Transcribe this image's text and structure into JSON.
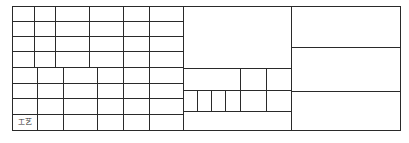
{
  "document": {
    "type": "title-block",
    "labels": {
      "process": "工艺"
    }
  },
  "line_color": "#2a2a2a",
  "grid": {
    "outer": {
      "x1": 12,
      "y1": 6,
      "x2": 400,
      "y2": 130
    },
    "left_top_cols": [
      12,
      34,
      55,
      89,
      123,
      149,
      183
    ],
    "left_top_rows": [
      6,
      21,
      36,
      51,
      67
    ],
    "left_bottom_cols": [
      12,
      37,
      63,
      97,
      123,
      149,
      183
    ],
    "left_bottom_rows": [
      67,
      83,
      98,
      114,
      130
    ],
    "middle": {
      "x1": 183,
      "x2": 291,
      "rows": [
        68,
        90,
        111,
        130
      ],
      "cols_upper": [
        240,
        266
      ],
      "small_cols": [
        197,
        211,
        225
      ]
    },
    "right": {
      "x1": 291,
      "x2": 400,
      "rows": [
        47,
        91
      ]
    }
  }
}
